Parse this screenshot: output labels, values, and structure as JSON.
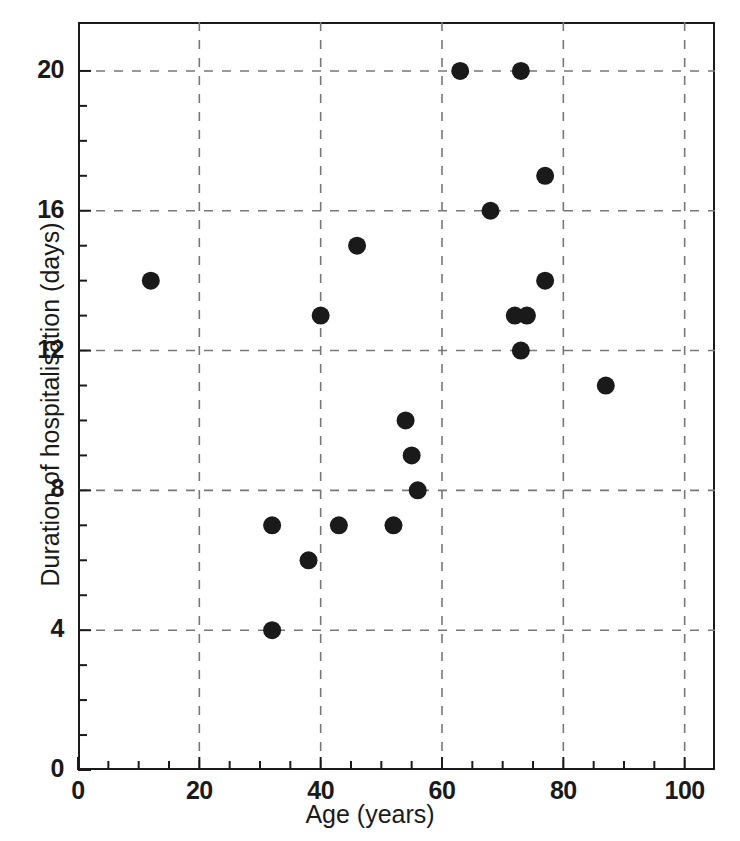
{
  "chart_data": {
    "type": "scatter",
    "title": "",
    "xlabel": "Age (years)",
    "ylabel": "Duration of hospitalisation (days)",
    "xlim": [
      0,
      105
    ],
    "ylim": [
      0,
      21.4
    ],
    "xticks": [
      0,
      20,
      40,
      60,
      80,
      100
    ],
    "yticks": [
      0,
      4,
      8,
      12,
      16,
      20
    ],
    "xtick_labels": [
      "0",
      "20",
      "40",
      "60",
      "80",
      "100"
    ],
    "ytick_labels": [
      "0",
      "4",
      "8",
      "12",
      "16",
      "20"
    ],
    "x_minor_tick_step": 5,
    "y_minor_tick_step": 1,
    "grid": "dashed-both",
    "grid_color": "#777777",
    "marker_color": "#1a1a1a",
    "marker_shape": "circle",
    "marker_radius_px": 9,
    "legend": "none",
    "points": [
      {
        "x": 12,
        "y": 14
      },
      {
        "x": 32,
        "y": 4
      },
      {
        "x": 32,
        "y": 7
      },
      {
        "x": 38,
        "y": 6
      },
      {
        "x": 40,
        "y": 13
      },
      {
        "x": 43,
        "y": 7
      },
      {
        "x": 46,
        "y": 15
      },
      {
        "x": 52,
        "y": 7
      },
      {
        "x": 54,
        "y": 10
      },
      {
        "x": 55,
        "y": 9
      },
      {
        "x": 56,
        "y": 8
      },
      {
        "x": 63,
        "y": 20
      },
      {
        "x": 68,
        "y": 16
      },
      {
        "x": 72,
        "y": 13
      },
      {
        "x": 73,
        "y": 20
      },
      {
        "x": 73,
        "y": 12
      },
      {
        "x": 74,
        "y": 13
      },
      {
        "x": 77,
        "y": 17
      },
      {
        "x": 77,
        "y": 14
      },
      {
        "x": 87,
        "y": 11
      }
    ]
  }
}
